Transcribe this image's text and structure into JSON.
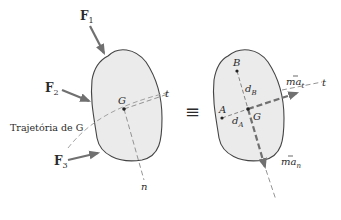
{
  "left_diagram": {
    "forces": [
      {
        "label": "F",
        "sub": "1"
      },
      {
        "label": "F",
        "sub": "2"
      },
      {
        "label": "F",
        "sub": "3"
      }
    ],
    "center_label": "G",
    "trajectory_label": "Trajetória de G",
    "tangent_label": "t",
    "normal_label": "n"
  },
  "equivalence_symbol": "≡",
  "right_diagram": {
    "point_b": "B",
    "point_a": "A",
    "center_label": "G",
    "dist_b": {
      "base": "d",
      "sub": "B"
    },
    "dist_a": {
      "base": "d",
      "sub": "A"
    },
    "tangential": {
      "base": "ma",
      "sub": "t"
    },
    "normal": {
      "base": "ma",
      "sub": "n"
    },
    "tangent_label": "t",
    "normal_label": "n"
  },
  "colors": {
    "body_fill": "#ebebeb",
    "body_stroke": "#444444",
    "arrow": "#707070",
    "dashed": "#888888",
    "text": "#2a2a2a"
  }
}
